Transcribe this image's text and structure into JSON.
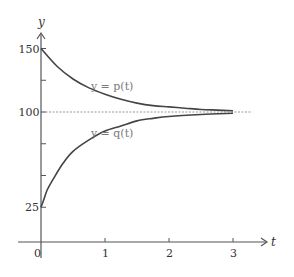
{
  "chart_data": {
    "type": "line",
    "title": "",
    "xlabel": "t",
    "ylabel": "y",
    "xlim": [
      0,
      3.5
    ],
    "ylim": [
      0,
      160
    ],
    "x_ticks": [
      {
        "value": 0,
        "label": "0"
      },
      {
        "value": 1,
        "label": "1"
      },
      {
        "value": 2,
        "label": "2"
      },
      {
        "value": 3,
        "label": "3"
      }
    ],
    "y_ticks": [
      {
        "value": 25,
        "label": "25"
      },
      {
        "value": 50,
        "label": ""
      },
      {
        "value": 75,
        "label": ""
      },
      {
        "value": 100,
        "label": "100"
      },
      {
        "value": 125,
        "label": ""
      },
      {
        "value": 150,
        "label": "150"
      }
    ],
    "reference_line": {
      "y": 100,
      "style": "dashed",
      "x_end": 3.3
    },
    "series": [
      {
        "name": "y = p(t)",
        "label_pos": {
          "t": 0.78,
          "y": 117
        },
        "x": [
          0,
          0.25,
          0.5,
          0.75,
          1.0,
          1.25,
          1.5,
          1.75,
          2.0,
          2.25,
          2.5,
          2.75,
          3.0
        ],
        "values": [
          150,
          136,
          126,
          119,
          114,
          110,
          107,
          105,
          104,
          103,
          102,
          101.5,
          101
        ]
      },
      {
        "name": "y = q(t)",
        "label_pos": {
          "t": 0.78,
          "y": 80
        },
        "x": [
          0,
          0.05,
          0.1,
          0.2,
          0.35,
          0.5,
          0.75,
          1.0,
          1.25,
          1.5,
          1.75,
          2.0,
          2.5,
          3.0
        ],
        "values": [
          25,
          32,
          39,
          48,
          60,
          69,
          78,
          85,
          89,
          93,
          95,
          96.5,
          98,
          99
        ]
      }
    ],
    "grid": false,
    "legend": "inline labels"
  },
  "colors": {
    "axis": "#555555",
    "curve": "#444444",
    "dashed": "#999999",
    "curve_label": "#7a7a7a"
  }
}
